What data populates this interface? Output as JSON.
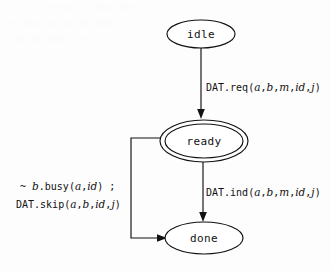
{
  "diagram": {
    "type": "state-machine",
    "background_color": "#fdfdfd",
    "stroke_color": "#111111",
    "nodes": [
      {
        "id": "idle",
        "label": "idle",
        "shape": "ellipse",
        "double": false,
        "cx": 201,
        "cy": 34,
        "rx": 34,
        "ry": 14
      },
      {
        "id": "ready",
        "label": "ready",
        "shape": "ellipse",
        "double": true,
        "cx": 204,
        "cy": 141,
        "rx": 44,
        "ry": 21
      },
      {
        "id": "done",
        "label": "done",
        "shape": "ellipse",
        "double": false,
        "cx": 204,
        "cy": 238,
        "rx": 39,
        "ry": 16
      }
    ],
    "edges": [
      {
        "id": "idle-to-ready",
        "from": "idle",
        "to": "ready",
        "label_lines": [
          [
            {
              "t": "DAT.req(",
              "style": "mono"
            },
            {
              "t": "a",
              "style": "italic"
            },
            {
              "t": ",",
              "style": "mono"
            },
            {
              "t": "b",
              "style": "italic"
            },
            {
              "t": ",",
              "style": "mono"
            },
            {
              "t": "m",
              "style": "italic"
            },
            {
              "t": ",",
              "style": "mono"
            },
            {
              "t": "id",
              "style": "italic"
            },
            {
              "t": ",",
              "style": "mono"
            },
            {
              "t": "j",
              "style": "italic"
            },
            {
              "t": ")",
              "style": "mono"
            }
          ]
        ],
        "label_plain": "DAT.req(a,b,m,id,j)",
        "label_x": 206,
        "label_y": 91
      },
      {
        "id": "ready-to-done",
        "from": "ready",
        "to": "done",
        "label_lines": [
          [
            {
              "t": "DAT.ind(",
              "style": "mono"
            },
            {
              "t": "a",
              "style": "italic"
            },
            {
              "t": ",",
              "style": "mono"
            },
            {
              "t": "b",
              "style": "italic"
            },
            {
              "t": ",",
              "style": "mono"
            },
            {
              "t": "m",
              "style": "italic"
            },
            {
              "t": ",",
              "style": "mono"
            },
            {
              "t": "id",
              "style": "italic"
            },
            {
              "t": ",",
              "style": "mono"
            },
            {
              "t": "j",
              "style": "italic"
            },
            {
              "t": ")",
              "style": "mono"
            }
          ]
        ],
        "label_plain": "DAT.ind(a,b,m,id,j)",
        "label_x": 206,
        "label_y": 196
      },
      {
        "id": "ready-to-done-skip",
        "from": "ready",
        "to": "done",
        "routing": "left-feedback",
        "label_lines": [
          [
            {
              "t": "~ ",
              "style": "mono"
            },
            {
              "t": "b",
              "style": "italic"
            },
            {
              "t": ".busy(",
              "style": "mono"
            },
            {
              "t": "a",
              "style": "italic"
            },
            {
              "t": ",",
              "style": "mono"
            },
            {
              "t": "id",
              "style": "italic"
            },
            {
              "t": ") ;",
              "style": "mono"
            }
          ],
          [
            {
              "t": "DAT.skip(",
              "style": "mono"
            },
            {
              "t": "a",
              "style": "italic"
            },
            {
              "t": ",",
              "style": "mono"
            },
            {
              "t": "b",
              "style": "italic"
            },
            {
              "t": ",",
              "style": "mono"
            },
            {
              "t": "id",
              "style": "italic"
            },
            {
              "t": ",",
              "style": "mono"
            },
            {
              "t": "j",
              "style": "italic"
            },
            {
              "t": ")",
              "style": "mono"
            }
          ]
        ],
        "label_plain_line1": "~ b.busy(a,id) ;",
        "label_plain_line2": "DAT.skip(a,b,id,j)",
        "label_x": 18,
        "label_y": 190
      }
    ]
  }
}
